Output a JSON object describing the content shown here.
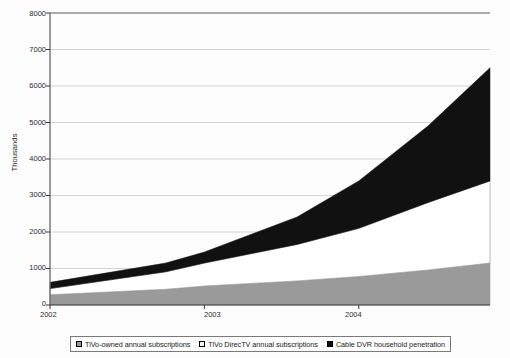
{
  "chart_data": {
    "type": "area",
    "stacked": true,
    "title": "",
    "xlabel": "",
    "ylabel": "Thousands",
    "ylim": [
      0,
      8000
    ],
    "ytick_labels": [
      "0",
      "1000",
      "2000",
      "3000",
      "4000",
      "5000",
      "6000",
      "7000",
      "8000"
    ],
    "ytick_values": [
      0,
      1000,
      2000,
      3000,
      4000,
      5000,
      6000,
      7000,
      8000
    ],
    "xtick_labels": [
      "2002",
      "2003",
      "2004"
    ],
    "xtick_values": [
      2002,
      2003,
      2004
    ],
    "xlim": [
      2002,
      2004.85
    ],
    "grid": true,
    "legend_position": "bottom",
    "x": [
      2002,
      2002.75,
      2003,
      2003.6,
      2004,
      2004.45,
      2004.85
    ],
    "series": [
      {
        "name": "TiVo-owned annual subscriptions",
        "color": "#9a9a9a",
        "values": [
          280,
          430,
          520,
          660,
          780,
          960,
          1150
        ]
      },
      {
        "name": "TiVo DirecTV annual subscriptions",
        "color": "#ffffff",
        "values": [
          170,
          480,
          630,
          1000,
          1320,
          1850,
          2250
        ]
      },
      {
        "name": "Cable DVR household penetration",
        "color": "#111111",
        "values": [
          170,
          240,
          300,
          750,
          1300,
          2100,
          3100
        ]
      }
    ],
    "cumulative_totals": [
      620,
      1150,
      1450,
      2410,
      3400,
      4910,
      6500
    ]
  },
  "legend": {
    "items": [
      {
        "label": "TiVo-owned annual subscriptions",
        "swatch": "#9a9a9a"
      },
      {
        "label": "TiVo DirecTV annual subscriptions",
        "swatch": "#ffffff"
      },
      {
        "label": "Cable DVR household penetration",
        "swatch": "#111111"
      }
    ]
  },
  "axis": {
    "y_title": "Thousands"
  }
}
